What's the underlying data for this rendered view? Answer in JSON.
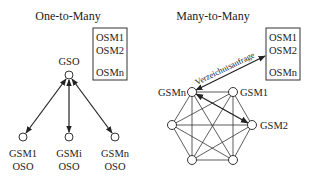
{
  "left": {
    "title": "One-to-Many",
    "server_label": "GSO",
    "registry_box": [
      "OSM1",
      "OSM2",
      "OSMn"
    ],
    "clients": [
      {
        "line1": "GSM1",
        "line2": "OSO"
      },
      {
        "line1": "GSMi",
        "line2": "OSO"
      },
      {
        "line1": "GSMn",
        "line2": "OSO"
      }
    ]
  },
  "right": {
    "title": "Many-to-Many",
    "registry_box": [
      "OSM1",
      "OSM2",
      "OSMn"
    ],
    "query_label": "Verzeichnisanfrage",
    "nodes": [
      "GSMn",
      "GSM1",
      "GSM2"
    ]
  }
}
